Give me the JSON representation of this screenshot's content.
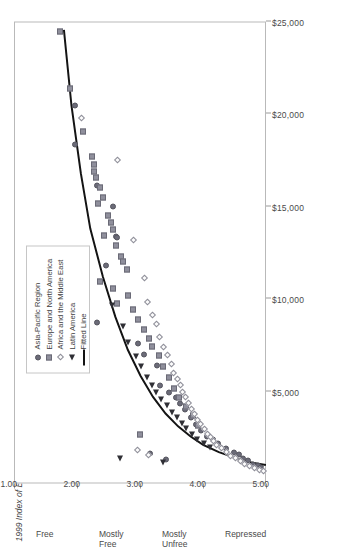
{
  "chart_data": {
    "type": "scatter",
    "title": "",
    "orientation": "rotated-90ccw",
    "xlabel": "1999 Index of Economic Freedom Score",
    "ylabel": "",
    "xlim": [
      1.0,
      5.0
    ],
    "ylim": [
      0,
      25000
    ],
    "grid": false,
    "legend_position": "upper-right",
    "x_tick_labels": [
      "1.00",
      "2.00",
      "3.00",
      "4.00",
      "5.00"
    ],
    "x_tick_values": [
      1.0,
      2.0,
      3.0,
      4.0,
      5.0
    ],
    "x_band_labels": [
      "Free",
      "Mostly Free",
      "Mostly Unfree",
      "Repressed"
    ],
    "x_band_centers": [
      1.5,
      2.5,
      3.5,
      4.5
    ],
    "y_tick_labels": [
      "$5,000",
      "$10,000",
      "$15,000",
      "$20,000",
      "$25,000"
    ],
    "y_tick_values": [
      5000,
      10000,
      15000,
      20000,
      25000
    ],
    "series": [
      {
        "name": "Asia-Pacific Region",
        "marker": "filled-circle",
        "color": "#6b6b78",
        "points": [
          [
            1.95,
            20400
          ],
          [
            1.95,
            18300
          ],
          [
            2.3,
            16050
          ],
          [
            2.55,
            14950
          ],
          [
            2.6,
            13300
          ],
          [
            2.62,
            13250
          ],
          [
            2.45,
            11750
          ],
          [
            2.3,
            8650
          ],
          [
            2.95,
            7500
          ],
          [
            3.05,
            6950
          ],
          [
            3.25,
            6350
          ],
          [
            3.3,
            5250
          ],
          [
            3.45,
            4850
          ],
          [
            3.55,
            4600
          ],
          [
            3.62,
            4300
          ],
          [
            3.7,
            3950
          ],
          [
            3.8,
            3500
          ],
          [
            3.88,
            3150
          ],
          [
            3.95,
            2800
          ],
          [
            4.05,
            2500
          ],
          [
            4.15,
            2300
          ],
          [
            4.22,
            2100
          ],
          [
            4.35,
            1850
          ],
          [
            4.48,
            1650
          ],
          [
            4.55,
            1500
          ],
          [
            4.62,
            1300
          ],
          [
            4.7,
            1200
          ],
          [
            4.78,
            1000
          ],
          [
            4.85,
            900
          ],
          [
            4.9,
            800
          ],
          [
            3.15,
            1550
          ],
          [
            3.4,
            1250
          ]
        ]
      },
      {
        "name": "Europe and North America",
        "marker": "filled-square",
        "color": "#8f8f9c",
        "points": [
          [
            1.72,
            24400
          ],
          [
            1.88,
            21300
          ],
          [
            2.08,
            19000
          ],
          [
            2.22,
            17650
          ],
          [
            2.25,
            17200
          ],
          [
            2.26,
            16850
          ],
          [
            2.28,
            16500
          ],
          [
            2.35,
            15950
          ],
          [
            2.4,
            15400
          ],
          [
            2.32,
            15100
          ],
          [
            2.48,
            14450
          ],
          [
            2.52,
            14050
          ],
          [
            2.55,
            13700
          ],
          [
            2.42,
            13350
          ],
          [
            2.6,
            12800
          ],
          [
            2.68,
            12250
          ],
          [
            2.72,
            11950
          ],
          [
            2.78,
            11500
          ],
          [
            2.35,
            10900
          ],
          [
            2.55,
            10500
          ],
          [
            2.8,
            10100
          ],
          [
            2.62,
            9700
          ],
          [
            2.88,
            9350
          ],
          [
            2.95,
            8800
          ],
          [
            3.05,
            8300
          ],
          [
            3.12,
            7800
          ],
          [
            3.18,
            7350
          ],
          [
            3.28,
            6850
          ],
          [
            3.35,
            6300
          ],
          [
            3.45,
            5700
          ],
          [
            3.52,
            5100
          ],
          [
            3.6,
            4600
          ],
          [
            3.72,
            4100
          ],
          [
            3.82,
            3600
          ],
          [
            3.9,
            3100
          ],
          [
            2.98,
            2600
          ]
        ]
      },
      {
        "name": "Africa and the Middle East",
        "marker": "open-diamond",
        "color": "#fdfdfd",
        "points": [
          [
            2.05,
            19700
          ],
          [
            2.62,
            17450
          ],
          [
            2.88,
            13100
          ],
          [
            3.05,
            11050
          ],
          [
            3.1,
            9750
          ],
          [
            3.18,
            9050
          ],
          [
            3.25,
            8550
          ],
          [
            3.3,
            7900
          ],
          [
            3.35,
            7350
          ],
          [
            3.42,
            6900
          ],
          [
            3.48,
            6400
          ],
          [
            3.52,
            5950
          ],
          [
            3.58,
            5600
          ],
          [
            3.62,
            5250
          ],
          [
            3.66,
            4900
          ],
          [
            3.7,
            4600
          ],
          [
            3.75,
            4300
          ],
          [
            3.8,
            4000
          ],
          [
            3.85,
            3700
          ],
          [
            3.9,
            3400
          ],
          [
            3.95,
            3150
          ],
          [
            4.0,
            2900
          ],
          [
            4.05,
            2650
          ],
          [
            4.1,
            2450
          ],
          [
            4.15,
            2250
          ],
          [
            4.2,
            2050
          ],
          [
            4.28,
            1850
          ],
          [
            4.35,
            1650
          ],
          [
            4.42,
            1450
          ],
          [
            4.5,
            1300
          ],
          [
            4.58,
            1150
          ],
          [
            4.65,
            1000
          ],
          [
            4.72,
            900
          ],
          [
            4.8,
            800
          ],
          [
            4.88,
            700
          ],
          [
            2.95,
            1750
          ],
          [
            3.12,
            1500
          ],
          [
            4.95,
            600
          ]
        ]
      },
      {
        "name": "Latin America",
        "marker": "filled-triangle",
        "color": "#2f2f35",
        "points": [
          [
            2.55,
            9600
          ],
          [
            2.72,
            8450
          ],
          [
            2.8,
            7550
          ],
          [
            2.92,
            6800
          ],
          [
            3.0,
            6250
          ],
          [
            3.1,
            5700
          ],
          [
            3.18,
            5250
          ],
          [
            3.25,
            4850
          ],
          [
            3.32,
            4500
          ],
          [
            3.42,
            4150
          ],
          [
            3.5,
            3800
          ],
          [
            3.58,
            3500
          ],
          [
            3.65,
            3200
          ],
          [
            3.72,
            2900
          ],
          [
            3.82,
            2600
          ],
          [
            3.9,
            2350
          ],
          [
            4.0,
            2100
          ],
          [
            4.1,
            1900
          ],
          [
            2.68,
            1300
          ],
          [
            3.35,
            1100
          ]
        ]
      }
    ],
    "fitted_line": {
      "name": "Fitted Line",
      "color": "#141414",
      "points": [
        [
          1.78,
          24600
        ],
        [
          1.9,
          20500
        ],
        [
          2.05,
          16800
        ],
        [
          2.2,
          13800
        ],
        [
          2.4,
          11200
        ],
        [
          2.6,
          9000
        ],
        [
          2.8,
          7200
        ],
        [
          3.0,
          5800
        ],
        [
          3.2,
          4650
        ],
        [
          3.4,
          3750
        ],
        [
          3.6,
          3050
        ],
        [
          3.8,
          2500
        ],
        [
          4.0,
          2050
        ],
        [
          4.25,
          1650
        ],
        [
          4.5,
          1350
        ],
        [
          4.75,
          1100
        ],
        [
          5.0,
          950
        ]
      ]
    }
  },
  "legend": {
    "items": [
      {
        "label": "Asia-Pacific Region",
        "marker": "filled-circle"
      },
      {
        "label": "Europe and North America",
        "marker": "filled-square"
      },
      {
        "label": "Africa and the Middle East",
        "marker": "open-diamond"
      },
      {
        "label": "Latin America",
        "marker": "filled-triangle"
      },
      {
        "label": "Fitted Line",
        "marker": "line"
      }
    ]
  }
}
